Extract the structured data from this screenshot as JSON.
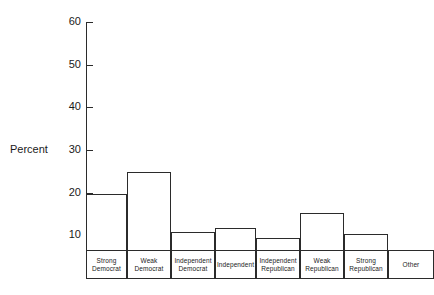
{
  "chart_data": {
    "type": "bar",
    "title": "",
    "subtitle": "",
    "xlabel": "",
    "ylabel": "Percent",
    "ylim": [
      0,
      60
    ],
    "ytick_labels": [
      "60",
      "50",
      "40",
      "30",
      "20",
      "10"
    ],
    "yticks": [
      60,
      50,
      40,
      30,
      20,
      10
    ],
    "grid": false,
    "legend": null,
    "categories": [
      "Strong Democrat",
      "Weak Democrat",
      "Independent Democrat",
      "Independent",
      "Independent Republican",
      "Weak Republican",
      "Strong Republican",
      "Other"
    ],
    "category_lines": [
      [
        "Strong",
        "Democrat"
      ],
      [
        "Weak",
        "Democrat"
      ],
      [
        "Independent",
        "Democrat"
      ],
      [
        "Independent",
        ""
      ],
      [
        "Independent",
        "Republican"
      ],
      [
        "Weak",
        "Republican"
      ],
      [
        "Strong",
        "Republican"
      ],
      [
        "Other",
        ""
      ]
    ],
    "values": [
      20,
      25,
      11,
      12,
      9.5,
      15.5,
      10.5,
      3
    ],
    "bar_widths_px": [
      41,
      44,
      44,
      41,
      44,
      44,
      44,
      46
    ],
    "bar_color": "#ffffff",
    "bar_edge_color": "#2b2b2b",
    "axis_color": "#2b2b2b",
    "background_color": "#ffffff"
  },
  "axis": {
    "y_title": "Percent"
  }
}
